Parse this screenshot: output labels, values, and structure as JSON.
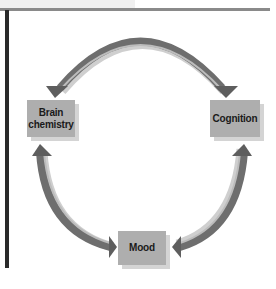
{
  "diagram": {
    "type": "cycle",
    "nodes": [
      {
        "id": "brain",
        "label": "Brain chemistry"
      },
      {
        "id": "cognition",
        "label": "Cognition"
      },
      {
        "id": "mood",
        "label": "Mood"
      }
    ],
    "edges": [
      {
        "from": "brain",
        "to": "cognition",
        "bidirectional": true
      },
      {
        "from": "cognition",
        "to": "mood",
        "bidirectional": true
      },
      {
        "from": "mood",
        "to": "brain",
        "bidirectional": true
      }
    ],
    "colors": {
      "node_fill": "#aeaeae",
      "node_shadow": "#d4d4d4",
      "arrow_dark": "#6e6e6e",
      "arrow_light": "#c8c8c8",
      "rule": "#8a8a8a",
      "left_bar": "#2a2a2a"
    }
  }
}
